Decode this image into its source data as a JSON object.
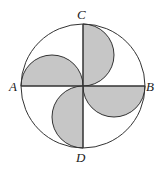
{
  "diagram": {
    "circle": {
      "cx": 83,
      "cy": 86,
      "r": 62
    },
    "colors": {
      "stroke": "#333333",
      "shade": "#c6c6c6",
      "background": "#ffffff"
    },
    "labels": {
      "A": "A",
      "B": "B",
      "C": "C",
      "D": "D"
    }
  }
}
